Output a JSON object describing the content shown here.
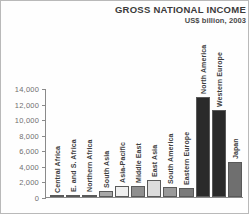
{
  "chart_data": {
    "type": "bar",
    "title": "GROSS NATIONAL INCOME",
    "subtitle": "US$ billion, 2003",
    "xlabel": "",
    "ylabel": "",
    "ylim": [
      0,
      14000
    ],
    "ytick_labels": [
      "14,000",
      "12,000",
      "10,000",
      "8,000",
      "6,000",
      "4,000",
      "2,000",
      "0"
    ],
    "ytick_values": [
      14000,
      12000,
      10000,
      8000,
      6000,
      4000,
      2000,
      0
    ],
    "grid": false,
    "legend": "none",
    "categories": [
      "Central Africa",
      "E. and S. Africa",
      "Northern Africa",
      "South Asia",
      "Asia-Pacific",
      "Middle East",
      "East Asia",
      "South America",
      "Eastern Europe",
      "North America",
      "Western Europe",
      "Japan"
    ],
    "values": [
      120,
      230,
      300,
      750,
      1400,
      1400,
      2200,
      1300,
      1150,
      12900,
      11200,
      4500
    ],
    "bar_colors": [
      "#8f8f8f",
      "#8f8f8f",
      "#8f8f8f",
      "#a8a8a8",
      "#efefef",
      "#8f8f8f",
      "#dcdcdc",
      "#9a9a9a",
      "#7a7a7a",
      "#2a2a2a",
      "#2a2a2a",
      "#6f6f6f"
    ],
    "bar_border_color": "#595959",
    "axis_color": "#8a8a8a",
    "title_color": "#3b3b3b",
    "label_color": "#3d3d3d",
    "tick_label_color": "#6f6f6f",
    "background": "#ffffff",
    "frame_color": "#b9b9b9"
  }
}
